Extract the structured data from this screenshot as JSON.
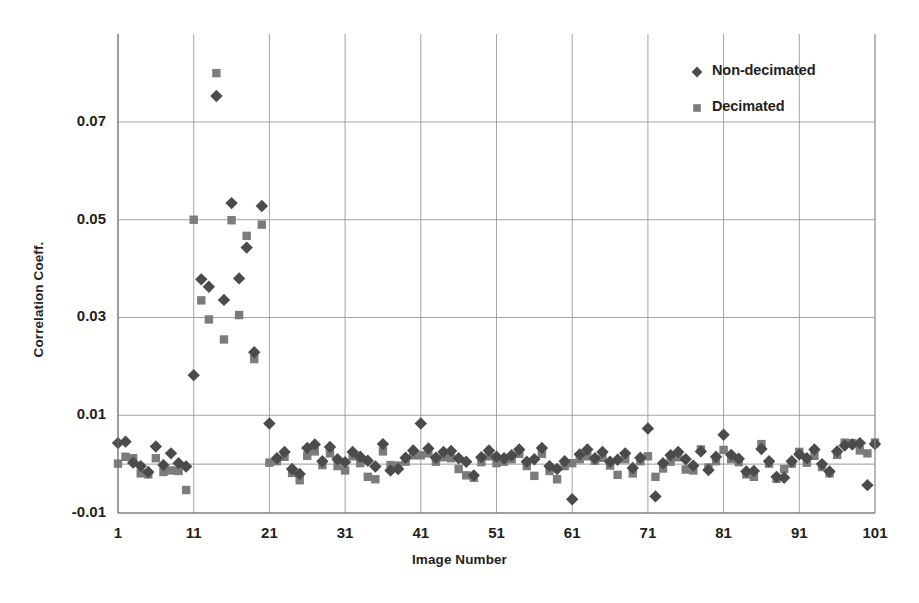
{
  "chart_data": {
    "type": "scatter",
    "title": "",
    "xlabel": "Image Number",
    "ylabel": "Correlation Coeff.",
    "xlim": [
      1,
      101
    ],
    "ylim": [
      -0.01,
      0.088
    ],
    "xticks": [
      1,
      11,
      21,
      31,
      41,
      51,
      61,
      71,
      81,
      91,
      101
    ],
    "yticks": [
      -0.01,
      0.01,
      0.03,
      0.05,
      0.07
    ],
    "ytick_labels": [
      "-0.01",
      "0.01",
      "0.03",
      "0.05",
      "0.07"
    ],
    "grid": "both",
    "legend_position": "top-right",
    "series": [
      {
        "name": "Non-decimated",
        "marker": "diamond",
        "color": "#4b4b4b",
        "x": [
          1,
          2,
          3,
          4,
          5,
          6,
          7,
          8,
          9,
          10,
          11,
          12,
          13,
          14,
          15,
          16,
          17,
          18,
          19,
          20,
          21,
          22,
          23,
          24,
          25,
          26,
          27,
          28,
          29,
          30,
          31,
          32,
          33,
          34,
          35,
          36,
          37,
          38,
          39,
          40,
          41,
          42,
          43,
          44,
          45,
          46,
          47,
          48,
          49,
          50,
          51,
          52,
          53,
          54,
          55,
          56,
          57,
          58,
          59,
          60,
          61,
          62,
          63,
          64,
          65,
          66,
          67,
          68,
          69,
          70,
          71,
          72,
          73,
          74,
          75,
          76,
          77,
          78,
          79,
          80,
          81,
          82,
          83,
          84,
          85,
          86,
          87,
          88,
          89,
          90,
          91,
          92,
          93,
          94,
          95,
          96,
          97,
          98,
          99,
          100,
          101
        ],
        "y": [
          0.0043,
          0.0046,
          0.0003,
          -0.0004,
          -0.0016,
          0.0036,
          -0.0002,
          0.0022,
          0.0002,
          -0.0005,
          0.0182,
          0.0378,
          0.0363,
          0.0753,
          0.0336,
          0.0534,
          0.038,
          0.0443,
          0.0229,
          0.0528,
          0.0083,
          0.0012,
          0.0025,
          -0.001,
          -0.002,
          0.0033,
          0.004,
          0.0006,
          0.0035,
          0.001,
          0.0004,
          0.0025,
          0.0015,
          0.0007,
          -0.0005,
          0.0041,
          -0.0013,
          -0.001,
          0.0013,
          0.0028,
          0.0083,
          0.0032,
          0.0013,
          0.0025,
          0.0027,
          0.0012,
          0.0005,
          -0.0023,
          0.0014,
          0.0028,
          0.0015,
          0.0012,
          0.0018,
          0.003,
          0.0005,
          0.001,
          0.0033,
          -0.0004,
          -0.001,
          0.0006,
          -0.0072,
          0.002,
          0.003,
          0.0012,
          0.0025,
          0.0005,
          0.0009,
          0.0022,
          -0.0008,
          0.0013,
          0.0073,
          -0.0066,
          0.0002,
          0.0018,
          0.0025,
          0.001,
          -0.0003,
          0.0026,
          -0.0012,
          0.0015,
          0.006,
          0.0019,
          0.0011,
          -0.0015,
          -0.0014,
          0.0031,
          0.0006,
          -0.0026,
          -0.0028,
          0.0006,
          0.002,
          0.0012,
          0.003,
          0.0,
          -0.0015,
          0.0026,
          0.0038,
          0.004,
          0.0043,
          -0.0043,
          0.0041
        ]
      },
      {
        "name": "Decimated",
        "marker": "square",
        "color": "#7c7c7c",
        "x": [
          1,
          2,
          3,
          4,
          5,
          6,
          7,
          8,
          9,
          10,
          11,
          12,
          13,
          14,
          15,
          16,
          17,
          18,
          19,
          20,
          21,
          22,
          23,
          24,
          25,
          26,
          27,
          28,
          29,
          30,
          31,
          32,
          33,
          34,
          35,
          36,
          37,
          38,
          39,
          40,
          41,
          42,
          43,
          44,
          45,
          46,
          47,
          48,
          49,
          50,
          51,
          52,
          53,
          54,
          55,
          56,
          57,
          58,
          59,
          60,
          61,
          62,
          63,
          64,
          65,
          66,
          67,
          68,
          69,
          70,
          71,
          72,
          73,
          74,
          75,
          76,
          77,
          78,
          79,
          80,
          81,
          82,
          83,
          84,
          85,
          86,
          87,
          88,
          89,
          90,
          91,
          92,
          93,
          94,
          95,
          96,
          97,
          98,
          99,
          100,
          101
        ],
        "y": [
          0.0001,
          0.0015,
          0.0012,
          -0.0019,
          -0.0021,
          0.0012,
          -0.0016,
          -0.0013,
          -0.0014,
          -0.0053,
          0.05,
          0.0335,
          0.0296,
          0.08,
          0.0255,
          0.0499,
          0.0305,
          0.0467,
          0.0215,
          0.049,
          0.0003,
          0.0006,
          0.0015,
          -0.0018,
          -0.0033,
          0.0017,
          0.0026,
          -0.0002,
          0.0022,
          -0.0004,
          -0.0013,
          0.0016,
          0.0002,
          -0.0026,
          -0.0031,
          0.0026,
          -0.0002,
          -0.0003,
          0.0005,
          0.0018,
          0.0018,
          0.0022,
          0.0005,
          0.0014,
          0.0012,
          -0.001,
          -0.0023,
          -0.0028,
          0.0004,
          0.0016,
          0.0002,
          0.0005,
          0.001,
          0.0021,
          -0.0004,
          -0.0024,
          0.0021,
          -0.0014,
          -0.0031,
          -0.0004,
          0.0002,
          0.001,
          0.0016,
          0.0007,
          0.0013,
          -0.0003,
          -0.0022,
          0.001,
          -0.0019,
          0.0006,
          0.0016,
          -0.0026,
          -0.0009,
          0.0005,
          0.0014,
          -0.0011,
          -0.0013,
          0.003,
          -0.0007,
          0.0006,
          0.0029,
          0.001,
          0.0004,
          -0.0021,
          -0.0026,
          0.0041,
          0.0001,
          -0.003,
          -0.001,
          0.0001,
          0.0025,
          0.0003,
          0.0017,
          -0.0006,
          -0.0019,
          0.0019,
          0.0044,
          0.0043,
          0.0028,
          0.0022,
          0.0044
        ]
      }
    ]
  },
  "axes": {
    "ylabel": "Correlation Coeff.",
    "xlabel": "Image Number",
    "ytick_labels": [
      "0.07",
      "0.05",
      "0.03",
      "0.01",
      "-0.01"
    ],
    "xtick_labels": [
      "1",
      "11",
      "21",
      "31",
      "41",
      "51",
      "61",
      "71",
      "81",
      "91",
      "101"
    ]
  },
  "legend": {
    "items": [
      {
        "label": "Non-decimated",
        "marker": "diamond",
        "color": "#4b4b4b"
      },
      {
        "label": "Decimated",
        "marker": "square",
        "color": "#7c7c7c"
      }
    ]
  },
  "style": {
    "grid_color": "#9a9a9a",
    "axis_color": "#6f6f6f",
    "background": "#ffffff"
  }
}
